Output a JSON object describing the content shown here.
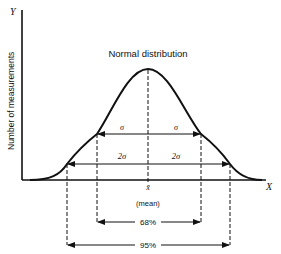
{
  "diagram": {
    "title": "Normal distribution",
    "y_axis": {
      "letter": "Y",
      "label": "Number of measurements"
    },
    "x_axis": {
      "letter": "X"
    },
    "mean": {
      "symbol": "x̄",
      "label": "(mean)"
    },
    "one_sigma": {
      "left_label": "σ",
      "right_label": "σ",
      "percent_label": "68%"
    },
    "two_sigma": {
      "left_label": "2σ",
      "right_label": "2σ",
      "percent_label": "95%"
    },
    "colors": {
      "ink": "#111111",
      "background": "#ffffff"
    }
  }
}
